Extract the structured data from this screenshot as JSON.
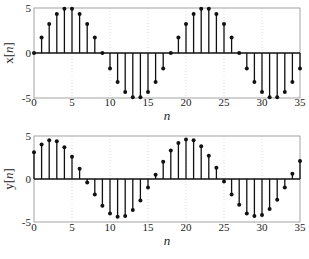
{
  "chart_data": [
    {
      "type": "stem",
      "title": "",
      "xlabel": "n",
      "ylabel": "x[n]",
      "ylabel_parts": {
        "pre": "x[",
        "var": "n",
        "post": "]"
      },
      "xlim": [
        0,
        35
      ],
      "ylim": [
        -5,
        5
      ],
      "xticks": [
        0,
        5,
        10,
        15,
        20,
        25,
        30,
        35
      ],
      "yticks": [
        -5,
        0,
        5
      ],
      "grid": "vertical dotted",
      "x": [
        0,
        1,
        2,
        3,
        4,
        5,
        6,
        7,
        8,
        9,
        10,
        11,
        12,
        13,
        14,
        15,
        16,
        17,
        18,
        19,
        20,
        21,
        22,
        23,
        24,
        25,
        26,
        27,
        28,
        29,
        30,
        31,
        32,
        33,
        34,
        35
      ],
      "values": [
        0,
        1.71,
        3.21,
        4.33,
        4.92,
        4.92,
        4.33,
        3.21,
        1.71,
        0,
        -1.71,
        -3.21,
        -4.33,
        -4.92,
        -4.92,
        -4.33,
        -3.21,
        -1.71,
        0,
        1.71,
        3.21,
        4.33,
        4.92,
        4.92,
        4.33,
        3.21,
        1.71,
        0,
        -1.71,
        -3.21,
        -4.33,
        -4.92,
        -4.92,
        -4.33,
        -3.21,
        -1.71
      ]
    },
    {
      "type": "stem",
      "title": "",
      "xlabel": "n",
      "ylabel": "y[n]",
      "ylabel_parts": {
        "pre": "y[",
        "var": "n",
        "post": "]"
      },
      "xlim": [
        0,
        35
      ],
      "ylim": [
        -5,
        5
      ],
      "xticks": [
        0,
        5,
        10,
        15,
        20,
        25,
        30,
        35
      ],
      "yticks": [
        -5,
        0,
        5
      ],
      "grid": "vertical dotted",
      "x": [
        0,
        1,
        2,
        3,
        4,
        5,
        6,
        7,
        8,
        9,
        10,
        11,
        12,
        13,
        14,
        15,
        16,
        17,
        18,
        19,
        20,
        21,
        22,
        23,
        24,
        25,
        26,
        27,
        28,
        29,
        30,
        31,
        32,
        33,
        34,
        35
      ],
      "values": [
        3.1,
        4.0,
        4.5,
        4.4,
        3.7,
        2.6,
        1.2,
        -0.4,
        -1.8,
        -3.1,
        -4.0,
        -4.4,
        -4.3,
        -3.6,
        -2.5,
        -1.0,
        0.5,
        2.0,
        3.3,
        4.2,
        4.6,
        4.5,
        3.8,
        2.7,
        1.3,
        -0.3,
        -1.8,
        -3.0,
        -4.0,
        -4.3,
        -4.2,
        -3.5,
        -2.4,
        -1.0,
        0.6,
        2.1
      ]
    }
  ],
  "layout": {
    "panels": [
      {
        "left": 34,
        "right": 300,
        "top": 8,
        "bottom": 98,
        "tick_y": 106,
        "xlabel_y": 120
      },
      {
        "left": 34,
        "right": 300,
        "top": 136,
        "bottom": 222,
        "tick_y": 231,
        "xlabel_y": 245
      }
    ],
    "colors": {
      "stem": "#111111",
      "axis": "#9a9a9a",
      "grid": "#d4d4d4",
      "zero": "#111111"
    }
  }
}
